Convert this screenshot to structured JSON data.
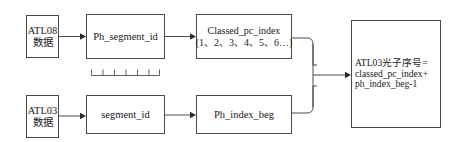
{
  "diagram": {
    "type": "flowchart",
    "title": "",
    "accent_color": "#4a4a4a",
    "background": "#ffffff",
    "nodes": {
      "atl08_data": {
        "line1": "ATL08",
        "line2": "数据"
      },
      "ph_segment_id": {
        "line1": "Ph_segment_id",
        "decoration": "comb-ruler-icon"
      },
      "classed_pc_index": {
        "line1": "Classed_pc_index",
        "line2": "(1、2、3、4、5、6…)"
      },
      "atl03_data": {
        "line1": "ATL03",
        "line2": "数据"
      },
      "segment_id": {
        "line1": "segment_id",
        "decoration": "staple-bracket-icon"
      },
      "ph_index_beg": {
        "line1": "Ph_index_beg"
      },
      "result": {
        "line1": "ATL03光子序号=",
        "line2": "classed_pc_index+",
        "line3": "ph_index_beg-1"
      }
    },
    "edges": [
      {
        "from": "atl08_data",
        "to": "ph_segment_id"
      },
      {
        "from": "ph_segment_id",
        "to": "classed_pc_index"
      },
      {
        "from": "atl03_data",
        "to": "segment_id"
      },
      {
        "from": "segment_id",
        "to": "ph_index_beg"
      },
      {
        "from": "classed_pc_index",
        "to": "result"
      },
      {
        "from": "ph_index_beg",
        "to": "result"
      }
    ]
  }
}
